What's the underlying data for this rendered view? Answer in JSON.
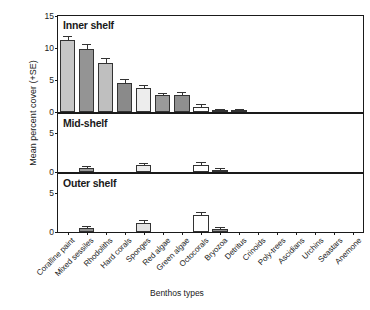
{
  "chart_data": {
    "type": "bar",
    "title": "",
    "xlabel": "Benthos types",
    "ylabel": "Mean percent cover (+SE)",
    "grid": false,
    "legend": "none",
    "categories": [
      "Coralline paint",
      "Mixed sessiles",
      "Rhodoliths",
      "Hard corals",
      "Sponges",
      "Red algae",
      "Green algae",
      "Octocorals",
      "Bryozoa",
      "Detritus",
      "Crinoids",
      "Poly-trees",
      "Ascidians",
      "Urchins",
      "Seastars",
      "Anemone"
    ],
    "panels": [
      {
        "name": "Inner shelf",
        "ylim": [
          0,
          15
        ],
        "yticks": [
          0,
          5,
          10,
          15
        ],
        "values": [
          11.2,
          9.9,
          7.7,
          4.6,
          3.7,
          2.6,
          2.7,
          0.8,
          0.25,
          0.1,
          0,
          0,
          0,
          0,
          0,
          0
        ],
        "errors": [
          0.45,
          0.6,
          0.65,
          0.35,
          0.35,
          0.25,
          0.3,
          0.25,
          0.1,
          0.05,
          0,
          0,
          0,
          0,
          0,
          0
        ],
        "shades": [
          "#c6c6c6",
          "#949494",
          "#bfbfbf",
          "#8a8a8a",
          "#ededed",
          "#9a9a9a",
          "#8f8f8f",
          "#ffffff",
          "#b3b3b3",
          "#ffffff",
          "#ffffff",
          "#ffffff",
          "#ffffff",
          "#ffffff",
          "#ffffff",
          "#ffffff"
        ]
      },
      {
        "name": "Mid-shelf",
        "ylim": [
          0,
          7.5
        ],
        "yticks": [
          0,
          5
        ],
        "values": [
          0,
          0.55,
          0,
          0,
          0.85,
          0,
          0,
          0.95,
          0.3,
          0,
          0,
          0,
          0,
          0,
          0,
          0
        ],
        "errors": [
          0,
          0.12,
          0,
          0,
          0.18,
          0,
          0,
          0.2,
          0.08,
          0,
          0,
          0,
          0,
          0,
          0,
          0
        ],
        "shades": [
          "#ffffff",
          "#9a9a9a",
          "#ffffff",
          "#ffffff",
          "#ededed",
          "#ffffff",
          "#ffffff",
          "#ffffff",
          "#b0b0b0",
          "#ffffff",
          "#ffffff",
          "#ffffff",
          "#ffffff",
          "#ffffff",
          "#ffffff",
          "#ffffff"
        ]
      },
      {
        "name": "Outer shelf",
        "ylim": [
          0,
          7.5
        ],
        "yticks": [
          0,
          5
        ],
        "values": [
          0,
          0.55,
          0,
          0,
          1.2,
          0,
          0,
          2.2,
          0.45,
          0,
          0,
          0,
          0,
          0,
          0,
          0
        ],
        "errors": [
          0,
          0.12,
          0,
          0,
          0.2,
          0,
          0,
          0.22,
          0.12,
          0,
          0,
          0,
          0,
          0,
          0,
          0
        ],
        "shades": [
          "#ffffff",
          "#8f8f8f",
          "#ffffff",
          "#ffffff",
          "#e2e2e2",
          "#ffffff",
          "#ffffff",
          "#ffffff",
          "#8f8f8f",
          "#ffffff",
          "#ffffff",
          "#ffffff",
          "#ffffff",
          "#ffffff",
          "#ffffff",
          "#ffffff"
        ]
      }
    ]
  }
}
